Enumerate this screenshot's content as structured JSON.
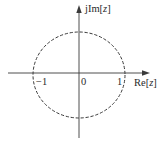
{
  "diagram": {
    "axes": {
      "x_label_prefix": "Re[",
      "x_label_var": "z",
      "x_label_suffix": "]",
      "y_label_prefix": "jIm[",
      "y_label_var": "z",
      "y_label_suffix": "]"
    },
    "ticks": {
      "neg_one": "−1",
      "origin": "0",
      "pos_one": "1"
    },
    "circle": {
      "radius": 1,
      "style": "dashed"
    },
    "colors": {
      "stroke": "#3a3a3a",
      "text": "#2a2a2a",
      "background": "#ffffff"
    }
  }
}
